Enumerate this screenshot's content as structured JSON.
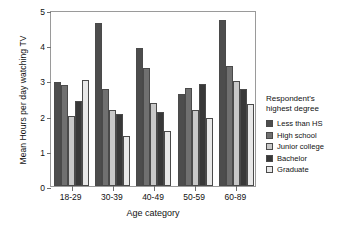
{
  "chart_data": {
    "type": "bar",
    "title": "",
    "subtitle": "",
    "xlabel": "Age category",
    "ylabel": "Mean Hours per day watching TV",
    "categories": [
      "18-29",
      "30-39",
      "40-49",
      "50-59",
      "60-89"
    ],
    "ylim": [
      0,
      5
    ],
    "yticks": [
      0,
      1,
      2,
      3,
      4,
      5
    ],
    "ytick_labels": [
      "0",
      "1",
      "2",
      "3",
      "4",
      "5"
    ],
    "grid": false,
    "legend_position": "right",
    "legend_title": "Respondent's highest degree",
    "series": [
      {
        "name": "Less than HS",
        "color": "#4d4d4d",
        "values": [
          2.95,
          4.64,
          3.93,
          2.6,
          4.71
        ]
      },
      {
        "name": "High school",
        "color": "#707070",
        "values": [
          2.88,
          2.75,
          3.34,
          2.78,
          3.4
        ]
      },
      {
        "name": "Junior college",
        "color": "#c8c8c8",
        "values": [
          2.0,
          2.16,
          2.36,
          2.17,
          2.97
        ]
      },
      {
        "name": "Bachelor",
        "color": "#383838",
        "values": [
          2.42,
          2.04,
          2.1,
          2.89,
          2.75
        ]
      },
      {
        "name": "Graduate",
        "color": "#e8e8e8",
        "values": [
          3.0,
          1.42,
          1.55,
          1.92,
          2.33
        ]
      }
    ]
  },
  "legend": {
    "title_line1": "Respondent's",
    "title_line2": "highest degree"
  }
}
